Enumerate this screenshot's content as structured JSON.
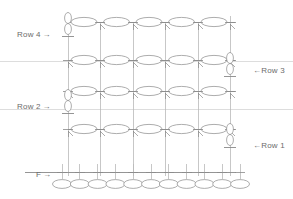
{
  "diagram": {
    "canvas": {
      "width": 293,
      "height": 199
    },
    "colors": {
      "line": "#8a8a8a",
      "line_light": "#b9b9b9",
      "guide": "#cfcfcf",
      "ellipse_stroke": "#8a8a8a",
      "text": "#6b6b6b",
      "background": "#ffffff"
    },
    "labels": [
      {
        "name": "row-4-label",
        "text": "Row 4",
        "arrow": "right",
        "x": 17,
        "y": 30,
        "arrow_x": 50,
        "arrow_y": 33
      },
      {
        "name": "row-3-label",
        "text": "Row 3",
        "arrow": "left",
        "x": 253,
        "y": 66,
        "arrow_x": 241,
        "arrow_y": 69
      },
      {
        "name": "row-2-label",
        "text": "Row 2",
        "arrow": "right",
        "x": 17,
        "y": 102,
        "arrow_x": 50,
        "arrow_y": 105
      },
      {
        "name": "row-1-label",
        "text": "Row 1",
        "arrow": "left",
        "x": 253,
        "y": 141,
        "arrow_x": 241,
        "arrow_y": 144
      },
      {
        "name": "f-label",
        "text": "F",
        "arrow": "right",
        "x": 36,
        "y": 170,
        "arrow_x": 45,
        "arrow_y": 173
      }
    ],
    "guide_lines": [
      {
        "name": "guide-line-upper",
        "y": 61
      },
      {
        "name": "guide-line-lower",
        "y": 109
      }
    ],
    "verticals_x": [
      68,
      100,
      133,
      165,
      198,
      230
    ],
    "bus_rows_y": [
      22,
      60,
      91,
      129
    ],
    "foundation_row_y": 172,
    "foundation_ellipse_y": 184,
    "bus_ellipse_counts": [
      5,
      5,
      5,
      5
    ],
    "foundation_ellipse_count": 11,
    "vertical_ellipse_groups": [
      {
        "name": "left-stack-top",
        "x": 68,
        "y_start": 18,
        "count": 2
      },
      {
        "name": "left-stack-middle",
        "x": 68,
        "y_start": 95,
        "count": 2
      },
      {
        "name": "right-stack-upper",
        "x": 230,
        "y_start": 58,
        "count": 2
      },
      {
        "name": "right-stack-lower",
        "x": 230,
        "y_start": 129,
        "count": 2
      }
    ]
  }
}
